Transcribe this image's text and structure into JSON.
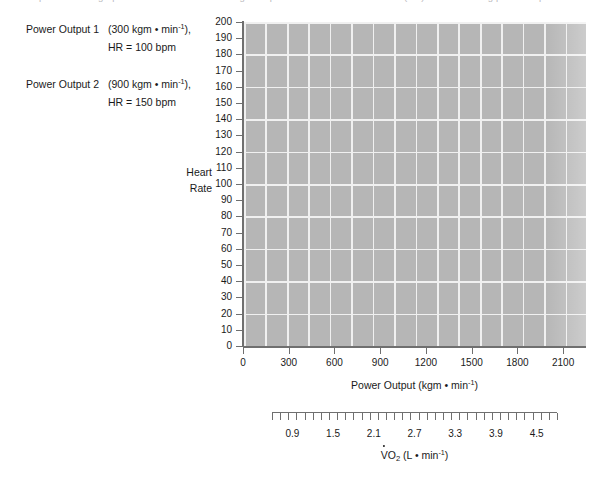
{
  "page": {
    "top_cutoff_text": "the the points on the graph and then draw a line through the points. Estimate the heart rate (HR) at the following power outputs."
  },
  "legend": {
    "items": [
      {
        "name": "Power Output 1",
        "value_prefix": "(300 kgm • min",
        "value_exp": "-1",
        "value_suffix": "),",
        "sub": "HR = 100 bpm"
      },
      {
        "name": "Power Output 2",
        "value_prefix": "(900 kgm • min",
        "value_exp": "-1",
        "value_suffix": "),",
        "sub": "HR = 150 bpm"
      }
    ]
  },
  "chart_data": {
    "type": "scatter",
    "title": "",
    "xlabel_prefix": "Power Output (kgm • min",
    "xlabel_exp": "-1",
    "xlabel_suffix": ")",
    "ylabel_line1": "Heart",
    "ylabel_line2": "Rate",
    "x": [],
    "y": [],
    "series": [
      {
        "name": "Heart Rate vs Power Output",
        "values": []
      }
    ],
    "xlim": [
      0,
      2250
    ],
    "ylim": [
      0,
      200
    ],
    "x_ticks": [
      0,
      300,
      600,
      900,
      1200,
      1500,
      1800,
      2100
    ],
    "y_ticks": [
      200,
      190,
      180,
      170,
      160,
      150,
      140,
      130,
      120,
      110,
      100,
      90,
      80,
      70,
      60,
      50,
      40,
      30,
      20,
      10,
      0
    ],
    "grid": true,
    "grid_x_step": 150,
    "grid_y_step": 20,
    "plot_bg_color": "#b6b6b6",
    "grid_color": "#f0f0f0",
    "axis_color": "#6f6f6f",
    "legend_position": "none",
    "secondary_axis": {
      "label_prefix": "O",
      "label_sub": "2",
      "label_suffix": " (L • min",
      "label_exp": "-1",
      "label_end": ")",
      "label_v": "V",
      "ticks": [
        0.9,
        1.5,
        2.1,
        2.7,
        3.3,
        3.9,
        4.5
      ],
      "tick_labels": [
        "0.9",
        "1.5",
        "2.1",
        "2.7",
        "3.3",
        "3.9",
        "4.5"
      ],
      "minor_per_major": 5,
      "range": [
        0.6,
        4.8
      ]
    }
  }
}
